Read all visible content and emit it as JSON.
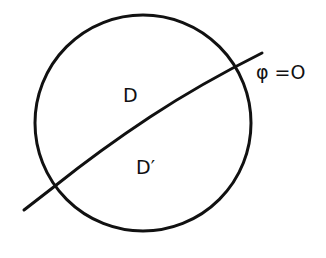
{
  "diagram": {
    "region_upper_label": "D",
    "region_lower_label": "D′",
    "curve_label": "φ =O",
    "circle": {
      "cx": 143,
      "cy": 123,
      "r": 108
    },
    "line": {
      "x1": 24,
      "y1": 210,
      "x2": 262,
      "y2": 53
    },
    "stroke_color": "#111111"
  }
}
